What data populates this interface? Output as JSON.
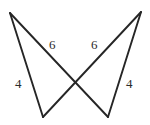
{
  "figure": {
    "background_color": "#ffffff",
    "stroke_color": "#262626",
    "label_color": "#2b2b2b",
    "canvas": {
      "width": 150,
      "height": 125
    },
    "vertices": [
      {
        "name": "top-left",
        "x": 10,
        "y": 13
      },
      {
        "name": "top-right",
        "x": 141,
        "y": 12
      },
      {
        "name": "bottom-left",
        "x": 43,
        "y": 117
      },
      {
        "name": "bottom-right",
        "x": 108,
        "y": 117
      },
      {
        "name": "intersection",
        "x": 75,
        "y": 85
      }
    ],
    "segments": [
      {
        "name": "left-leg",
        "from": "top-left",
        "to": "bottom-left",
        "label": "4"
      },
      {
        "name": "left-hypotenuse",
        "from": "top-left",
        "to": "bottom-right",
        "label": "6"
      },
      {
        "name": "right-leg",
        "from": "top-right",
        "to": "bottom-right",
        "label": "4"
      },
      {
        "name": "right-hypotenuse",
        "from": "top-right",
        "to": "bottom-left",
        "label": "6"
      }
    ],
    "labels": {
      "top_left_six": "6",
      "top_right_six": "6",
      "left_four": "4",
      "right_four": "4"
    }
  }
}
